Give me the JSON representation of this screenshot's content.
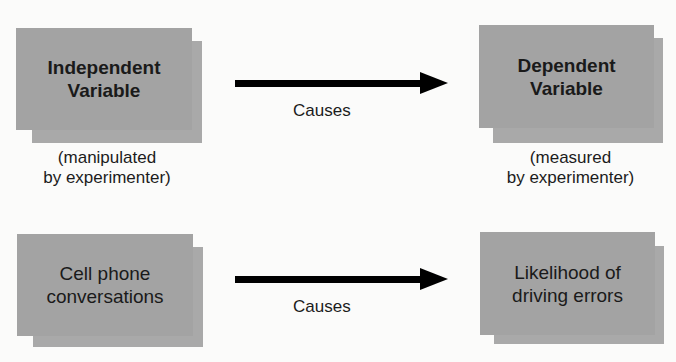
{
  "diagram": {
    "rows": [
      {
        "left": {
          "title": "Independent\nVariable",
          "line1": "Independent",
          "line2": "Variable",
          "caption1": "(manipulated",
          "caption2": "by experimenter)"
        },
        "relation": "Causes",
        "right": {
          "title": "Dependent\nVariable",
          "line1": "Dependent",
          "line2": "Variable",
          "caption1": "(measured",
          "caption2": "by experimenter)"
        }
      },
      {
        "left": {
          "line1": "Cell phone",
          "line2": "conversations"
        },
        "relation": "Causes",
        "right": {
          "line1": "Likelihood of",
          "line2": "driving errors"
        }
      }
    ],
    "colors": {
      "box": "#a3a3a3",
      "shadow": "#a9a9a9",
      "arrow": "#000000",
      "background": "#fbfbfa"
    }
  }
}
